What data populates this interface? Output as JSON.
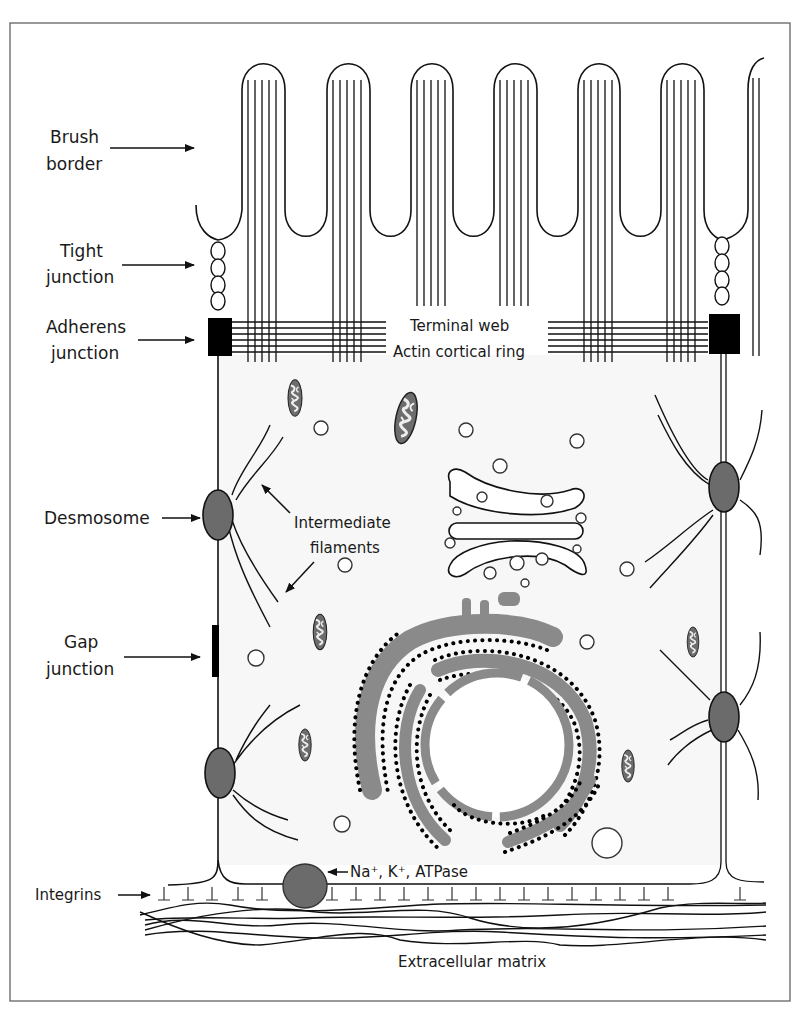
{
  "figure": {
    "colors": {
      "line": "#111111",
      "desmosome_fill": "#6b6b6b",
      "er_fill": "#8a8a8a",
      "atpase_fill": "#6b6b6b",
      "cytoplasm": "#f7f7f7",
      "background": "#ffffff"
    }
  },
  "labels": {
    "brush_border": [
      "Brush",
      "border"
    ],
    "tight_junction": [
      "Tight",
      "junction"
    ],
    "adherens_junction": [
      "Adherens",
      "junction"
    ],
    "terminal_web": "Terminal web",
    "actin_cortical_ring": "Actin cortical ring",
    "desmosome": "Desmosome",
    "intermediate_filaments": [
      "Intermediate",
      "filaments"
    ],
    "gap_junction": [
      "Gap",
      "junction"
    ],
    "integrins": "Integrins",
    "atpase": "Na⁺, K⁺, ATPase",
    "extracellular_matrix": "Extracellular matrix"
  }
}
